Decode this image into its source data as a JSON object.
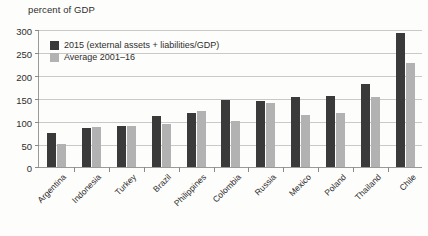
{
  "chart_data": {
    "type": "bar",
    "title": "percent of GDP",
    "xlabel": "",
    "ylabel": "percent of GDP",
    "ylim": [
      0,
      300
    ],
    "yticks": [
      0,
      50,
      100,
      150,
      200,
      250,
      300
    ],
    "grid": true,
    "legend_position": "top-left",
    "categories": [
      "Argentina",
      "Indonesia",
      "Turkey",
      "Brazil",
      "Philippines",
      "Colombia",
      "Russia",
      "Mexico",
      "Poland",
      "Thailand",
      "Chile"
    ],
    "series": [
      {
        "name": "2015 (external assets + liabilities/GDP)",
        "color": "#3a3a3a",
        "values": [
          74,
          85,
          89,
          110,
          117,
          145,
          143,
          152,
          155,
          181,
          292
        ]
      },
      {
        "name": "Average 2001–16",
        "color": "#b2b2b2",
        "values": [
          50,
          87,
          89,
          94,
          121,
          99,
          140,
          112,
          117,
          152,
          226
        ]
      }
    ]
  },
  "legend": {
    "items": [
      {
        "label": "2015 (external assets + liabilities/GDP)",
        "color": "#3a3a3a"
      },
      {
        "label": "Average 2001–16",
        "color": "#b2b2b2"
      }
    ]
  }
}
